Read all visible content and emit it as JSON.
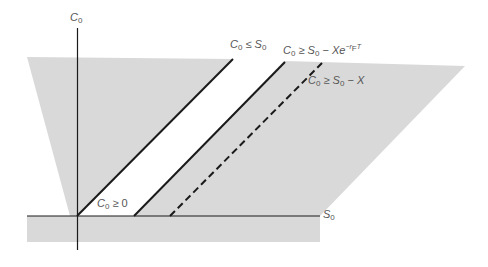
{
  "diagram": {
    "colors": {
      "background": "#ffffff",
      "shaded_region": "#d9d9d9",
      "lines": "#1a1a1a",
      "label_text": "#555555"
    },
    "axes": {
      "y_label": {
        "var": "C",
        "sub": "0"
      },
      "x_label": {
        "var": "S",
        "sub": "0"
      }
    },
    "bounds": [
      {
        "id": "lower-bound-zero",
        "style": "none",
        "label": {
          "lhs": "C",
          "lhs_sub": "0",
          "op": "≥",
          "rhs": "0"
        }
      },
      {
        "id": "upper-bound",
        "style": "solid",
        "label": {
          "lhs": "C",
          "lhs_sub": "0",
          "op": "≤",
          "rhs": "S",
          "rhs_sub": "0"
        }
      },
      {
        "id": "lower-bound-discounted",
        "style": "solid",
        "label": {
          "lhs": "C",
          "lhs_sub": "0",
          "op": "≥",
          "rhs": "S",
          "rhs_sub": "0",
          "minus": "−",
          "term": "Xe",
          "exp": "−r",
          "exp_sub": "F",
          "exp_tail": "T"
        }
      },
      {
        "id": "lower-bound-intrinsic",
        "style": "dashed",
        "label": {
          "lhs": "C",
          "lhs_sub": "0",
          "op": "≥",
          "rhs": "S",
          "rhs_sub": "0",
          "minus": "−",
          "term": "X"
        }
      }
    ]
  }
}
